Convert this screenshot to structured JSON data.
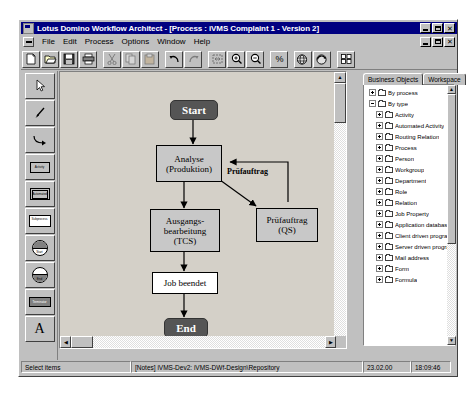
{
  "window": {
    "title": "Lotus Domino Workflow Architect - [Process : iVMS Complaint 1 - Version 2]",
    "app_icon": "app-icon",
    "minimize_label": "_",
    "maximize_label": "□",
    "close_label": "✕"
  },
  "menu": {
    "system_icon": "system-menu-icon",
    "items": [
      {
        "label": "File"
      },
      {
        "label": "Edit"
      },
      {
        "label": "Process"
      },
      {
        "label": "Options"
      },
      {
        "label": "Window"
      },
      {
        "label": "Help"
      }
    ]
  },
  "toolbar": {
    "buttons": [
      {
        "name": "new-icon",
        "title": "New"
      },
      {
        "name": "open-icon",
        "title": "Open"
      },
      {
        "name": "save-icon",
        "title": "Save"
      },
      {
        "name": "print-icon",
        "title": "Print"
      },
      {
        "name": "cut-icon",
        "title": "Cut"
      },
      {
        "name": "copy-icon",
        "title": "Copy"
      },
      {
        "name": "paste-icon",
        "title": "Paste"
      },
      {
        "name": "undo-icon",
        "title": "Undo"
      },
      {
        "name": "redo-icon",
        "title": "Redo"
      },
      {
        "name": "fit-icon",
        "title": "Fit to window"
      },
      {
        "name": "zoom-in-icon",
        "title": "Zoom in"
      },
      {
        "name": "zoom-out-icon",
        "title": "Zoom out"
      },
      {
        "name": "zoom-percent-icon",
        "title": "Zoom percentage"
      },
      {
        "name": "globe-icon",
        "title": "Web view"
      },
      {
        "name": "refresh-globe-icon",
        "title": "Refresh"
      },
      {
        "name": "grid-icon",
        "title": "Grid"
      }
    ]
  },
  "palette": {
    "tools": [
      {
        "name": "select-arrow-tool",
        "label": ""
      },
      {
        "name": "pointer-tool",
        "label": ""
      },
      {
        "name": "connector-tool",
        "label": ""
      },
      {
        "name": "activity-tool",
        "label": "Activity"
      },
      {
        "name": "automated-activity-tool",
        "label": "Automated Activity"
      },
      {
        "name": "subprocess-tool",
        "label": "Subprocess"
      },
      {
        "name": "start-node-tool",
        "label": "Start"
      },
      {
        "name": "end-node-tool",
        "label": "End"
      },
      {
        "name": "terminator-tool",
        "label": "Terminator"
      },
      {
        "name": "text-tool",
        "label": "A"
      }
    ]
  },
  "canvas": {
    "nodes": [
      {
        "id": "start",
        "type": "terminator",
        "label": "Start"
      },
      {
        "id": "analyse",
        "type": "task",
        "label": "Analyse\n(Produktion)"
      },
      {
        "id": "pruefauftrag-qs",
        "type": "task",
        "label": "Prüfauftrag\n(QS)"
      },
      {
        "id": "ausgangsbearbeitung",
        "type": "task",
        "label": "Ausgangs-\nbearbeitung\n(TCS)"
      },
      {
        "id": "job-beendet",
        "type": "plain",
        "label": "Job beendet"
      },
      {
        "id": "end",
        "type": "terminator",
        "label": "End"
      }
    ],
    "edge_labels": [
      {
        "id": "pruefauftrag-label",
        "label": "Prüfauftrag"
      }
    ],
    "node_text": {
      "start": "Start",
      "analyse_line1": "Analyse",
      "analyse_line2": "(Produktion)",
      "qs_line1": "Prüfauftrag",
      "qs_line2": "(QS)",
      "aus_line1": "Ausgangs-",
      "aus_line2": "bearbeitung",
      "aus_line3": "(TCS)",
      "job": "Job beendet",
      "end": "End",
      "edge_pruefauftrag": "Prüfauftrag"
    }
  },
  "right_panel": {
    "tabs": [
      {
        "label": "Business Objects",
        "active": true
      },
      {
        "label": "Workspace",
        "active": false
      }
    ],
    "tree": [
      {
        "level": 1,
        "label": "By process",
        "expander": "plus"
      },
      {
        "level": 1,
        "label": "By type",
        "expander": "minus"
      },
      {
        "level": 2,
        "label": "Activity",
        "expander": "plus"
      },
      {
        "level": 2,
        "label": "Automated Activity",
        "expander": "plus"
      },
      {
        "level": 2,
        "label": "Routing Relation",
        "expander": "plus"
      },
      {
        "level": 2,
        "label": "Process",
        "expander": "plus"
      },
      {
        "level": 2,
        "label": "Person",
        "expander": "plus"
      },
      {
        "level": 2,
        "label": "Workgroup",
        "expander": "plus"
      },
      {
        "level": 2,
        "label": "Department",
        "expander": "plus"
      },
      {
        "level": 2,
        "label": "Role",
        "expander": "plus"
      },
      {
        "level": 2,
        "label": "Relation",
        "expander": "plus"
      },
      {
        "level": 2,
        "label": "Job Property",
        "expander": "plus"
      },
      {
        "level": 2,
        "label": "Application database",
        "expander": "plus"
      },
      {
        "level": 2,
        "label": "Client driven program",
        "expander": "plus"
      },
      {
        "level": 2,
        "label": "Server driven program",
        "expander": "plus"
      },
      {
        "level": 2,
        "label": "Mail address",
        "expander": "plus"
      },
      {
        "level": 2,
        "label": "Form",
        "expander": "plus"
      },
      {
        "level": 2,
        "label": "Formula",
        "expander": "plus"
      }
    ]
  },
  "statusbar": {
    "hint": "Select items",
    "connection": "[Notes] iVMS-Dev2: iVMS-DWf-Design\\Repository",
    "version": "23.02.00",
    "time": "18:09:46"
  },
  "colors": {
    "title_bar": "#000080",
    "face": "#c0c0c0",
    "canvas": "#d4d0c8",
    "terminator": "#555555",
    "task": "#c8c8c8"
  }
}
